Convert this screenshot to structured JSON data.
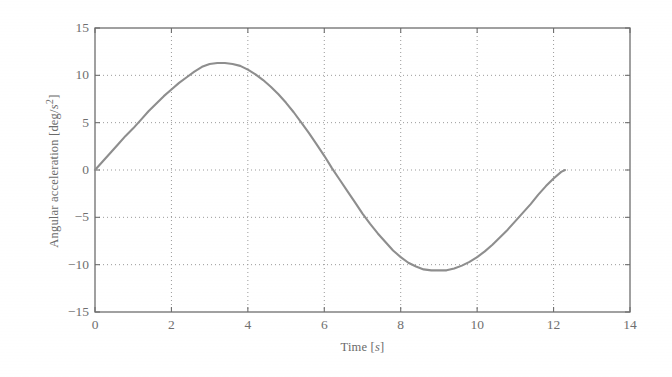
{
  "chart_data": {
    "type": "line",
    "title": "",
    "xlabel": "Time [s]",
    "xlabel_main": "Time [",
    "xlabel_unit": "s",
    "xlabel_close": "]",
    "ylabel": "Angular acceleration [deg/s²]",
    "ylabel_main": "Angular acceleration [deg/",
    "ylabel_unit": "s",
    "ylabel_sup": "2",
    "ylabel_close": "]",
    "xlim": [
      0,
      14
    ],
    "ylim": [
      -15,
      15
    ],
    "xticks": [
      0,
      2,
      4,
      6,
      8,
      10,
      12,
      14
    ],
    "xtick_labels": [
      "0",
      "2",
      "4",
      "6",
      "8",
      "10",
      "12",
      "14"
    ],
    "yticks": [
      -15,
      -10,
      -5,
      0,
      5,
      10,
      15
    ],
    "ytick_labels": [
      "−15",
      "−10",
      "−5",
      "0",
      "5",
      "10",
      "15"
    ],
    "grid": true,
    "grid_style": "dotted",
    "legend": null,
    "line_color": "#8e8e8e",
    "axis_color": "#6e6e6e",
    "grid_color": "#9a9a9a",
    "background_color": "#ffffff",
    "series": [
      {
        "name": "Angular acceleration",
        "x": [
          0.0,
          0.2,
          0.4,
          0.6,
          0.8,
          1.0,
          1.2,
          1.4,
          1.6,
          1.8,
          2.0,
          2.2,
          2.4,
          2.6,
          2.8,
          3.0,
          3.2,
          3.4,
          3.6,
          3.8,
          4.0,
          4.2,
          4.4,
          4.6,
          4.8,
          5.0,
          5.2,
          5.4,
          5.6,
          5.8,
          6.0,
          6.2,
          6.4,
          6.6,
          6.8,
          7.0,
          7.2,
          7.4,
          7.6,
          7.8,
          8.0,
          8.2,
          8.4,
          8.6,
          8.8,
          9.0,
          9.2,
          9.4,
          9.6,
          9.8,
          10.0,
          10.2,
          10.4,
          10.6,
          10.8,
          11.0,
          11.2,
          11.4,
          11.6,
          11.8,
          12.0,
          12.2,
          12.3
        ],
        "y": [
          0.0,
          0.9,
          1.8,
          2.7,
          3.6,
          4.4,
          5.3,
          6.2,
          7.0,
          7.8,
          8.5,
          9.2,
          9.8,
          10.4,
          10.9,
          11.2,
          11.3,
          11.3,
          11.2,
          11.0,
          10.6,
          10.1,
          9.5,
          8.8,
          8.0,
          7.1,
          6.1,
          5.0,
          3.9,
          2.7,
          1.5,
          0.2,
          -1.0,
          -2.2,
          -3.4,
          -4.6,
          -5.7,
          -6.7,
          -7.6,
          -8.5,
          -9.2,
          -9.8,
          -10.2,
          -10.5,
          -10.6,
          -10.6,
          -10.6,
          -10.4,
          -10.1,
          -9.7,
          -9.2,
          -8.6,
          -7.9,
          -7.1,
          -6.3,
          -5.4,
          -4.5,
          -3.6,
          -2.6,
          -1.7,
          -0.9,
          -0.2,
          0.0
        ],
        "peak_value": 11.3,
        "peak_time": 3.3,
        "min_value": -10.6,
        "min_time": 9.1,
        "zero_crossing_time": 6.15,
        "end_time": 12.3,
        "start_value": 0.0
      }
    ]
  }
}
